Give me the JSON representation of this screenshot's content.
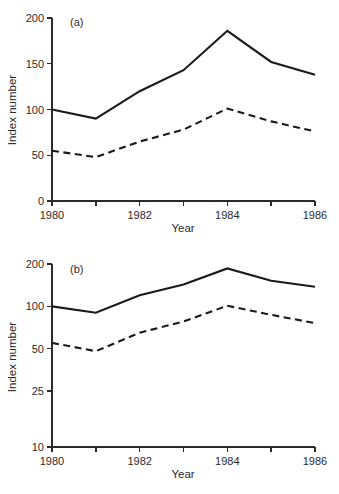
{
  "figure": {
    "background": "#ffffff",
    "line_color": "#1a1a1a",
    "axis_color": "#2b2b2b"
  },
  "panel_a": {
    "tag": "(a)",
    "xlabel": "Year",
    "ylabel": "Index number",
    "y_ticks": [
      "0",
      "50",
      "100",
      "150",
      "200"
    ],
    "x_ticks": [
      "1980",
      "",
      "1982",
      "",
      "1984",
      "",
      "1986"
    ]
  },
  "panel_b": {
    "tag": "(b)",
    "xlabel": "Year",
    "ylabel": "Index number",
    "y_ticks": [
      "10",
      "25",
      "50",
      "100",
      "200"
    ],
    "x_ticks": [
      "1980",
      "",
      "1982",
      "",
      "1984",
      "",
      "1986"
    ]
  },
  "chart_data": [
    {
      "type": "line",
      "title": "(a)",
      "xlabel": "Year",
      "ylabel": "Index number",
      "yscale": "linear",
      "ylim": [
        0,
        200
      ],
      "xlim": [
        1980,
        1986
      ],
      "grid": false,
      "legend": "none",
      "yticks": [
        0,
        50,
        100,
        150,
        200
      ],
      "xticks": [
        1980,
        1981,
        1982,
        1983,
        1984,
        1985,
        1986
      ],
      "xticklabels": [
        "1980",
        "",
        "1982",
        "",
        "1984",
        "",
        "1986"
      ],
      "x": [
        1980,
        1981,
        1982,
        1983,
        1984,
        1985,
        1986
      ],
      "series": [
        {
          "name": "solid-line",
          "style": "solid",
          "values": [
            100,
            90,
            120,
            143,
            186,
            152,
            138
          ]
        },
        {
          "name": "dashed-line",
          "style": "dashed",
          "values": [
            55,
            48,
            65,
            78,
            101,
            87,
            76
          ]
        }
      ]
    },
    {
      "type": "line",
      "title": "(b)",
      "xlabel": "Year",
      "ylabel": "Index number",
      "yscale": "log",
      "ylim": [
        10,
        200
      ],
      "xlim": [
        1980,
        1986
      ],
      "grid": false,
      "legend": "none",
      "yticks": [
        10,
        25,
        50,
        100,
        200
      ],
      "xticks": [
        1980,
        1981,
        1982,
        1983,
        1984,
        1985,
        1986
      ],
      "xticklabels": [
        "1980",
        "",
        "1982",
        "",
        "1984",
        "",
        "1986"
      ],
      "x": [
        1980,
        1981,
        1982,
        1983,
        1984,
        1985,
        1986
      ],
      "series": [
        {
          "name": "solid-line",
          "style": "solid",
          "values": [
            100,
            90,
            120,
            143,
            186,
            152,
            138
          ]
        },
        {
          "name": "dashed-line",
          "style": "dashed",
          "values": [
            55,
            48,
            65,
            78,
            101,
            87,
            76
          ]
        }
      ]
    }
  ]
}
